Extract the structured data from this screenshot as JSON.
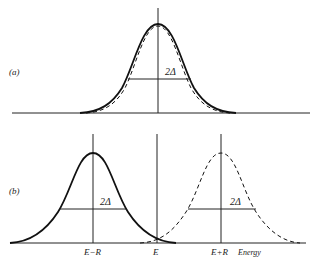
{
  "figure": {
    "panel_a": {
      "label": "(a)",
      "width_label": "2Δ",
      "curves": [
        "solid-gaussian",
        "dashed-gaussian"
      ]
    },
    "panel_b": {
      "label": "(b)",
      "width_label_left": "2Δ",
      "width_label_right": "2Δ",
      "tick_labels": [
        "E−R",
        "E",
        "E+R"
      ],
      "axis_label": "Energy",
      "curves": [
        "solid-gaussian-at-E-minus-R",
        "dashed-gaussian-at-E-plus-R"
      ]
    },
    "colors": {
      "ink": "#222222",
      "background": "#ffffff"
    }
  }
}
